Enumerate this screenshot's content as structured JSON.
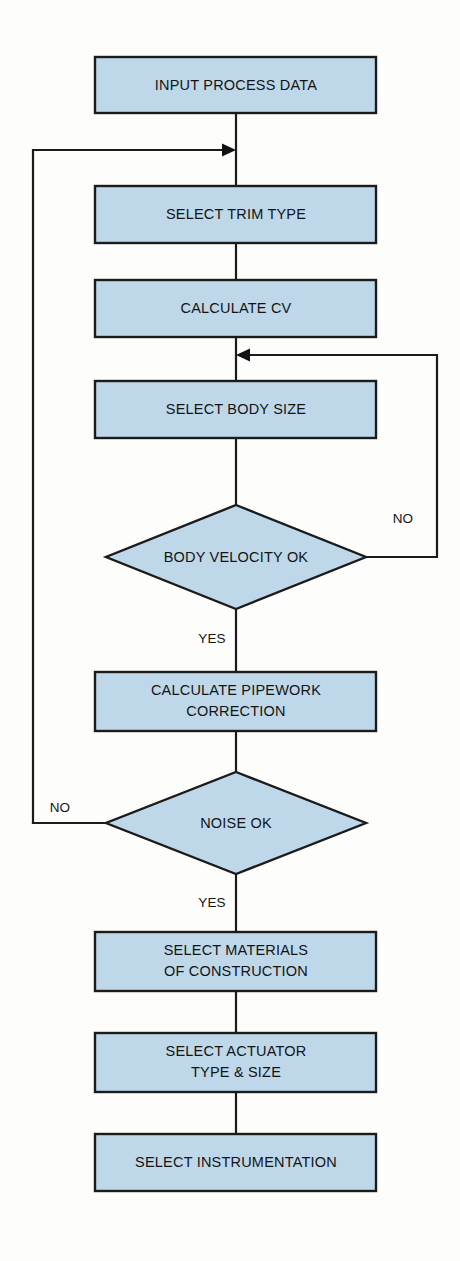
{
  "diagram": {
    "colors": {
      "node_fill": "#bed8ea",
      "node_stroke": "#1b1b1b",
      "edge_stroke": "#1b1b1b",
      "text": "#141414",
      "background": "#fdfdfc"
    },
    "nodes": [
      {
        "id": "input-process-data",
        "type": "process",
        "label": "INPUT PROCESS DATA"
      },
      {
        "id": "select-trim-type",
        "type": "process",
        "label": "SELECT TRIM TYPE"
      },
      {
        "id": "calculate-cv",
        "type": "process",
        "label": "CALCULATE CV"
      },
      {
        "id": "select-body-size",
        "type": "process",
        "label": "SELECT BODY SIZE"
      },
      {
        "id": "body-velocity-ok",
        "type": "decision",
        "label": "BODY VELOCITY OK"
      },
      {
        "id": "calculate-pipework",
        "type": "process",
        "label_line1": "CALCULATE PIPEWORK",
        "label_line2": "CORRECTION"
      },
      {
        "id": "noise-ok",
        "type": "decision",
        "label": "NOISE OK"
      },
      {
        "id": "select-materials",
        "type": "process",
        "label_line1": "SELECT MATERIALS",
        "label_line2": "OF CONSTRUCTION"
      },
      {
        "id": "select-actuator",
        "type": "process",
        "label_line1": "SELECT ACTUATOR",
        "label_line2": "TYPE & SIZE"
      },
      {
        "id": "select-instrumentation",
        "type": "process",
        "label": "SELECT INSTRUMENTATION"
      }
    ],
    "edge_labels": {
      "body_velocity_no": "NO",
      "body_velocity_yes": "YES",
      "noise_no": "NO",
      "noise_yes": "YES"
    }
  }
}
